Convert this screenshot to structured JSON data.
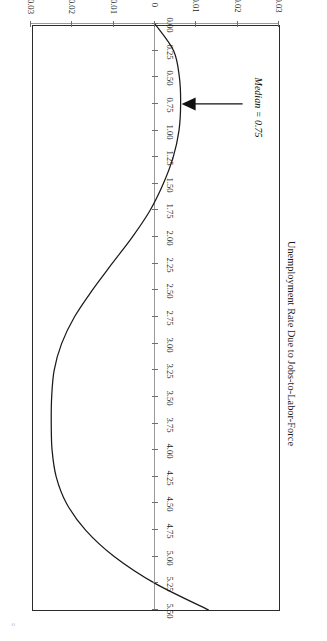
{
  "figure": {
    "rotation_degrees": 180,
    "background_color": "#ffffff",
    "frame_color": "#2b2b2b",
    "curve_color": "#1a1a1a",
    "axis_color": "#9a9a9a"
  },
  "annotation": {
    "label": "Median = 0.75",
    "arrow_target_x": 0.75
  },
  "corner_mark": "o",
  "chart_data": {
    "type": "line",
    "title": "",
    "subtitle": "",
    "xlabel": "",
    "ylabel": "Unemployment Rate Due to Jobs-to-Labor-Force",
    "grid": false,
    "legend": "none",
    "xlim": [
      0.0,
      5.5
    ],
    "ylim": [
      -0.03,
      0.03
    ],
    "xticks": [
      "0.00",
      "0.25",
      "0.50",
      "0.75",
      "1.00",
      "1.25",
      "1.50",
      "1.75",
      "2.00",
      "2.25",
      "2.50",
      "2.75",
      "3.00",
      "3.25",
      "3.50",
      "3.75",
      "4.00",
      "4.25",
      "4.50",
      "4.75",
      "5.00",
      "5.25",
      "5.50"
    ],
    "yticks": [
      "0.03",
      "0.02",
      "0.01",
      "0",
      "-0.01",
      "-0.02",
      "-0.03"
    ],
    "ytick_values": [
      0.03,
      0.02,
      0.01,
      0,
      -0.01,
      -0.02,
      -0.03
    ],
    "series": [
      {
        "name": "Unemployment Rate Due to Jobs-to-Labor-Force",
        "x": [
          0.0,
          0.25,
          0.5,
          0.75,
          1.0,
          1.25,
          1.5,
          1.75,
          2.0,
          2.25,
          2.5,
          2.75,
          3.0,
          3.25,
          3.5,
          3.75,
          4.0,
          4.25,
          4.5,
          4.75,
          5.0,
          5.25,
          5.5
        ],
        "values": [
          0.0,
          0.0045,
          0.0059,
          0.0062,
          0.0058,
          0.0044,
          0.002,
          -0.0012,
          -0.0055,
          -0.0104,
          -0.0152,
          -0.0195,
          -0.0226,
          -0.0244,
          -0.025,
          -0.0251,
          -0.0249,
          -0.0239,
          -0.0214,
          -0.0168,
          -0.0098,
          0.0,
          0.013
        ]
      }
    ],
    "annotations": [
      {
        "text": "Median = 0.75",
        "x": 0.75,
        "y": 0.0062
      }
    ]
  }
}
